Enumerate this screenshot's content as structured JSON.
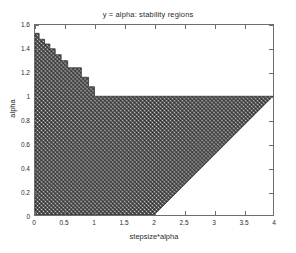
{
  "chart_data": {
    "type": "area",
    "title": "y = alpha: stability regions",
    "xlabel": "stepsize*alpha",
    "ylabel": "alpha",
    "xlim": [
      0,
      4
    ],
    "ylim": [
      0,
      1.6
    ],
    "grid": false,
    "legend": null,
    "xticks": [
      0,
      0.5,
      1,
      1.5,
      2,
      2.5,
      3,
      3.5,
      4
    ],
    "xtick_labels": [
      "0",
      "0.5",
      "1",
      "1.5",
      "2",
      "2.5",
      "3",
      "3.5",
      "4"
    ],
    "yticks": [
      0,
      0.2,
      0.4,
      0.6,
      0.8,
      1,
      1.2,
      1.4,
      1.6
    ],
    "ytick_labels": [
      "0",
      "0.2",
      "0.4",
      "0.6",
      "0.8",
      "1",
      "1.2",
      "1.4",
      "1.6"
    ],
    "fill_color": "#5a5a5a",
    "fill_pattern": "dither-checker",
    "edge_color": "#2b2b2b",
    "background_color": "#ffffff",
    "series": [
      {
        "name": "stability region",
        "description": "Shaded stable region: staircase upper boundary descending from alpha=1.53 at x=0.05 to alpha=1.0 at x=1.0, then flat top at alpha=1.0 out to x=4, with lower-right diagonal cut from (2,0) to (4,1).",
        "upper_boundary": [
          {
            "x": 0.0,
            "y": 1.53
          },
          {
            "x": 0.07,
            "y": 1.53
          },
          {
            "x": 0.07,
            "y": 1.48
          },
          {
            "x": 0.16,
            "y": 1.48
          },
          {
            "x": 0.16,
            "y": 1.44
          },
          {
            "x": 0.25,
            "y": 1.44
          },
          {
            "x": 0.25,
            "y": 1.4
          },
          {
            "x": 0.34,
            "y": 1.4
          },
          {
            "x": 0.34,
            "y": 1.35
          },
          {
            "x": 0.44,
            "y": 1.35
          },
          {
            "x": 0.44,
            "y": 1.3
          },
          {
            "x": 0.55,
            "y": 1.3
          },
          {
            "x": 0.55,
            "y": 1.24
          },
          {
            "x": 0.78,
            "y": 1.24
          },
          {
            "x": 0.78,
            "y": 1.16
          },
          {
            "x": 0.9,
            "y": 1.16
          },
          {
            "x": 0.9,
            "y": 1.08
          },
          {
            "x": 1.0,
            "y": 1.08
          },
          {
            "x": 1.0,
            "y": 1.0
          },
          {
            "x": 4.0,
            "y": 1.0
          }
        ],
        "lower_boundary": [
          {
            "x": 0.0,
            "y": 0.0
          },
          {
            "x": 2.0,
            "y": 0.0
          },
          {
            "x": 4.0,
            "y": 1.0
          }
        ]
      }
    ]
  }
}
